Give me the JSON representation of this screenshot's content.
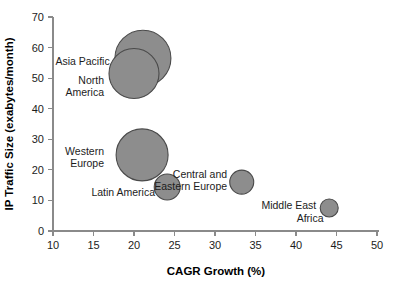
{
  "chart_data": {
    "type": "scatter",
    "title": "",
    "subtitle": "",
    "xlabel": "CAGR Growth (%)",
    "ylabel": "IP Traffic Size (exabytes/month)",
    "xlim": [
      10,
      50
    ],
    "ylim": [
      0,
      70
    ],
    "xticks": [
      10,
      15,
      20,
      25,
      30,
      35,
      40,
      45,
      50
    ],
    "yticks": [
      0,
      10,
      20,
      30,
      40,
      50,
      60,
      70
    ],
    "xtick_labels": [
      "10",
      "15",
      "20",
      "25",
      "30",
      "35",
      "40",
      "45",
      "50"
    ],
    "ytick_labels": [
      "0",
      "10",
      "20",
      "30",
      "40",
      "50",
      "60",
      "70"
    ],
    "grid": false,
    "legend": "none",
    "bubble_fill": "#8d8d8d",
    "bubble_stroke": "#4a4a4a",
    "points": [
      {
        "name": "Asia Pacific",
        "label": "Asia Pacific",
        "x": 21.1,
        "y": 56.5,
        "r_px": 28,
        "label_x": 17.0,
        "label_y": 55.5,
        "label_anchor": "end"
      },
      {
        "name": "North America",
        "label": "North",
        "label2": "America",
        "x": 20.0,
        "y": 51.5,
        "r_px": 25,
        "label_x": 16.3,
        "label_y": 49.5,
        "label2_x": 16.3,
        "label2_y": 45.5,
        "label_anchor": "end"
      },
      {
        "name": "Western Europe",
        "label": "Western",
        "label2": "Europe",
        "x": 21.0,
        "y": 24.9,
        "r_px": 26,
        "label_x": 16.3,
        "label_y": 26.3,
        "label2_x": 16.3,
        "label2_y": 22.3,
        "label_anchor": "end"
      },
      {
        "name": "Latin America",
        "label": "Latin America",
        "x": 24.1,
        "y": 14.4,
        "r_px": 13,
        "label_x": 22.6,
        "label_y": 12.6,
        "label_anchor": "end"
      },
      {
        "name": "Central and Eastern Europe",
        "label": "Central and",
        "label2": "Eastern Europe",
        "x": 33.3,
        "y": 16.0,
        "r_px": 12,
        "label_x": 31.5,
        "label_y": 18.6,
        "label2_x": 31.5,
        "label2_y": 14.7,
        "label_anchor": "end"
      },
      {
        "name": "Middle East Africa",
        "label": "Middle East",
        "label2": "Africa",
        "x": 44.1,
        "y": 7.5,
        "r_px": 9,
        "label_x": 42.5,
        "label_y": 8.5,
        "label2_x": 43.4,
        "label2_y": 4.4,
        "label_anchor": "end"
      }
    ]
  }
}
